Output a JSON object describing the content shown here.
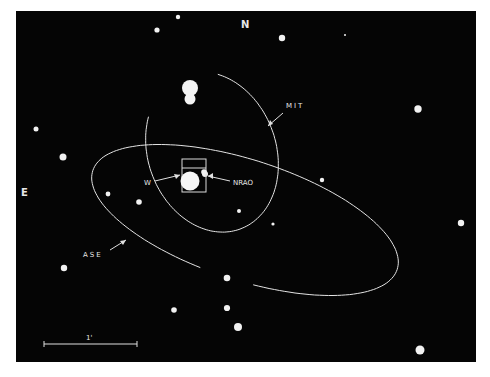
{
  "figure": {
    "background": "#050505",
    "foreground": "#f2f2f2",
    "frame": {
      "x": 16,
      "y": 11,
      "w": 460,
      "h": 351
    }
  },
  "orientation": {
    "north_label": "N",
    "east_label": "E"
  },
  "scale_bar": {
    "label": "1'",
    "x1": 44,
    "x2": 137,
    "y": 344
  },
  "labels": {
    "mit": "MIT",
    "ase": "ASE",
    "w": "W",
    "nrao": "NRAO"
  },
  "chart_data": {
    "type": "diagram",
    "title": "",
    "ellipses": [
      {
        "name": "MIT",
        "cx": 212,
        "cy": 152,
        "rx": 64,
        "ry": 82,
        "rotation": -20,
        "open_gap": "top"
      },
      {
        "name": "ASE",
        "cx": 245,
        "cy": 220,
        "rx": 160,
        "ry": 60,
        "rotation": 18,
        "open_gap": "bottom"
      }
    ],
    "box": {
      "x": 182,
      "y": 159,
      "w": 24,
      "h": 33
    },
    "stars": [
      {
        "x": 178,
        "y": 17,
        "r": 2.2
      },
      {
        "x": 157,
        "y": 30,
        "r": 2.6
      },
      {
        "x": 282,
        "y": 38,
        "r": 3.2
      },
      {
        "x": 345,
        "y": 35,
        "r": 1
      },
      {
        "x": 36,
        "y": 129,
        "r": 2.5
      },
      {
        "x": 63,
        "y": 157,
        "r": 3.5
      },
      {
        "x": 418,
        "y": 109,
        "r": 3.7
      },
      {
        "x": 108,
        "y": 194,
        "r": 2.4
      },
      {
        "x": 139,
        "y": 202,
        "r": 2.8
      },
      {
        "x": 322,
        "y": 180,
        "r": 2.2
      },
      {
        "x": 239,
        "y": 211,
        "r": 2
      },
      {
        "x": 273,
        "y": 224,
        "r": 1.6
      },
      {
        "x": 461,
        "y": 223,
        "r": 3.2
      },
      {
        "x": 64,
        "y": 268,
        "r": 3.2
      },
      {
        "x": 227,
        "y": 278,
        "r": 3.3
      },
      {
        "x": 174,
        "y": 310,
        "r": 2.8
      },
      {
        "x": 227,
        "y": 308,
        "r": 3.1
      },
      {
        "x": 238,
        "y": 327,
        "r": 4
      },
      {
        "x": 420,
        "y": 350,
        "r": 4.5
      },
      {
        "x": 205,
        "y": 174,
        "r": 3
      }
    ],
    "bright_objects": [
      {
        "name": "double-star-north",
        "x": 190,
        "y": 90,
        "r1": 8,
        "r2": 5.5,
        "dy": 11
      },
      {
        "name": "W",
        "x": 189,
        "y": 182,
        "r": 9.5
      }
    ],
    "annotations": [
      {
        "text": "N",
        "x": 245,
        "y": 27
      },
      {
        "text": "E",
        "x": 23,
        "y": 195
      },
      {
        "text": "MIT",
        "x": 285,
        "y": 108
      },
      {
        "text": "ASE",
        "x": 83,
        "y": 256
      },
      {
        "text": "W",
        "x": 144,
        "y": 184
      },
      {
        "text": "NRAO",
        "x": 235,
        "y": 184
      },
      {
        "text": "1'",
        "x": 88,
        "y": 340
      }
    ]
  }
}
